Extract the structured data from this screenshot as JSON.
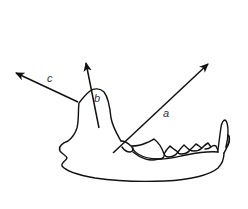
{
  "diagram": {
    "stroke_color": "#111111",
    "background": "#ffffff",
    "vectors": [
      {
        "label": "a",
        "from": [
          113,
          153
        ],
        "to": [
          208,
          64
        ],
        "label_pos": [
          163,
          111
        ]
      },
      {
        "label": "b",
        "from": [
          99,
          128
        ],
        "to": [
          86,
          63
        ],
        "label_pos": [
          94,
          96
        ]
      },
      {
        "label": "c",
        "from": [
          78,
          102
        ],
        "to": [
          16,
          73
        ],
        "label_pos": [
          47,
          76
        ]
      }
    ]
  }
}
